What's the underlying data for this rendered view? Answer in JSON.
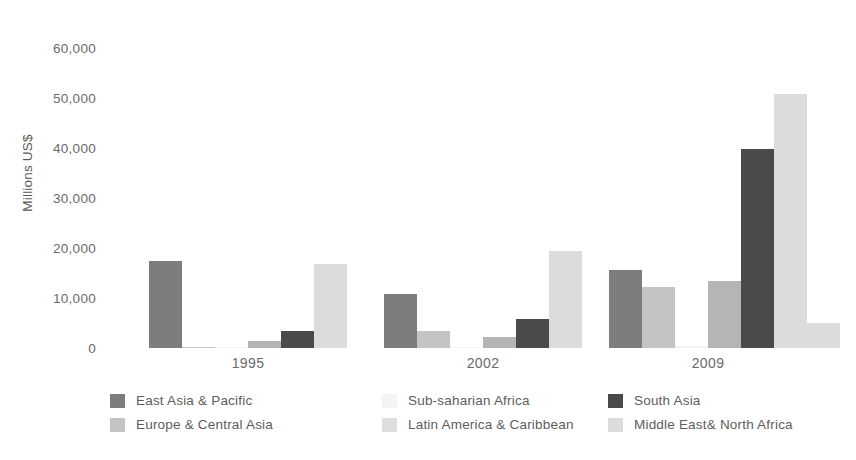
{
  "chart_data": {
    "type": "bar",
    "title": "",
    "subtitle": "",
    "xlabel": "",
    "ylabel": "Millions US$",
    "ylim": [
      0,
      60000
    ],
    "grid": false,
    "legend_position": "bottom",
    "categories": [
      "1995",
      "2002",
      "2009"
    ],
    "ytick_labels": [
      "60,000",
      "50,000",
      "40,000",
      "30,000",
      "20,000",
      "10,000",
      "0"
    ],
    "ytick_values": [
      60000,
      50000,
      40000,
      30000,
      20000,
      10000,
      0
    ],
    "series": [
      {
        "name": "East Asia & Pacific",
        "color": "#7d7d7d",
        "values": [
          17500,
          10800,
          15700
        ]
      },
      {
        "name": "Europe & Central Asia",
        "color": "#c4c4c4",
        "values": [
          300,
          3500,
          12300
        ]
      },
      {
        "name": "Sub-saharian Africa",
        "color": "#f4f4f4",
        "values": [
          200,
          300,
          400
        ]
      },
      {
        "name": "Latin America & Caribbean",
        "color": "#b5b5b5",
        "values": [
          1500,
          2200,
          13500
        ]
      },
      {
        "name": "South Asia",
        "color": "#4a4a4a",
        "values": [
          3500,
          5800,
          39800
        ]
      },
      {
        "name": "Middle East& North Africa",
        "color": "#dcdcdc",
        "values": [
          16800,
          19400,
          50800
        ]
      }
    ],
    "extra_bar_2009": {
      "name": "trailing-light-bar",
      "color": "#dcdcdc",
      "value": 5000
    }
  },
  "legend": {
    "columns": [
      {
        "items": [
          {
            "label": "East Asia & Pacific",
            "color": "#7d7d7d"
          },
          {
            "label": "Europe & Central Asia",
            "color": "#c4c4c4"
          }
        ]
      },
      {
        "items": [
          {
            "label": "Sub-saharian Africa",
            "color": "#f4f4f4"
          },
          {
            "label": "Latin America & Caribbean",
            "color": "#dedede"
          }
        ]
      },
      {
        "items": [
          {
            "label": "South Asia",
            "color": "#4a4a4a"
          },
          {
            "label": "Middle East& North Africa",
            "color": "#dcdcdc"
          }
        ]
      }
    ]
  }
}
